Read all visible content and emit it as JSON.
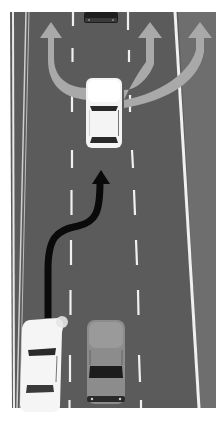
{
  "scene": {
    "description": "Overhead illustration of a multi-lane road showing lane change maneuver options",
    "colors": {
      "background": "#ffffff",
      "road": "#5a5a5a",
      "shoulder": "#7a7a7a",
      "lane_marking": "#f2f2f2",
      "grey_arrow": "#a8a8a8",
      "black_arrow": "#0a0a0a",
      "white_car": "#f4f4f4",
      "grey_car": "#8a8a8a",
      "window": "#2a2a2a"
    },
    "elements": {
      "top_car": "white car in middle lane with three grey arrows branching left, straight, right",
      "distant_car": "dark car far ahead in middle lane",
      "bottom_left_car": "white car in left lane with black path arrow curving to middle lane",
      "bottom_right_car": "grey car in middle lane"
    }
  }
}
